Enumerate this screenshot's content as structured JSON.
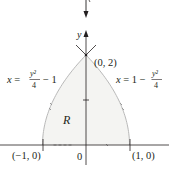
{
  "figure": {
    "region_label": "R",
    "y_axis_label": "y",
    "origin_label": "0",
    "points": [
      {
        "name": "top-vertex",
        "label": "(0, 2)",
        "x": 0,
        "y": 2
      },
      {
        "name": "left-vertex",
        "label": "(−1, 0)",
        "x": -1,
        "y": 0
      },
      {
        "name": "right-vertex",
        "label": "(1, 0)",
        "x": 1,
        "y": 0
      }
    ],
    "curves": [
      {
        "name": "left-curve",
        "lhs": "x =",
        "num": "y²",
        "den": "4",
        "tail": "− 1",
        "head": "",
        "equation": "x = y²/4 − 1"
      },
      {
        "name": "right-curve",
        "lhs": "x = 1 −",
        "num": "y²",
        "den": "4",
        "tail": "",
        "equation": "x = 1 − y²/4"
      }
    ],
    "colors": {
      "region_fill": "#f4f4f2",
      "curve": "#b9b9b9",
      "axis": "#231f20",
      "arrow_marks": "#9a9a9a"
    }
  }
}
